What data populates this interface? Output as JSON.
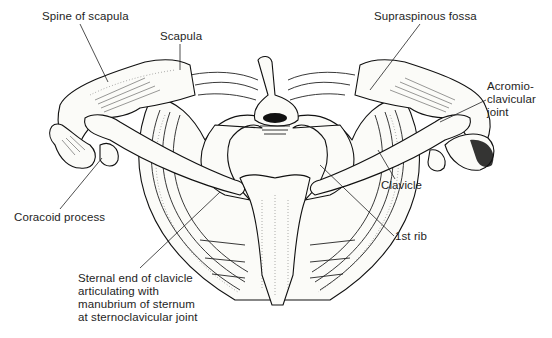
{
  "diagram": {
    "labels": [
      {
        "id": "spine-of-scapula",
        "text": "Spine of scapula",
        "x": 42,
        "y": 10
      },
      {
        "id": "scapula",
        "text": "Scapula",
        "x": 160,
        "y": 30
      },
      {
        "id": "supraspinous-fossa",
        "text": "Supraspinous fossa",
        "x": 374,
        "y": 10
      },
      {
        "id": "acromioclavicular-joint",
        "lines": [
          "Acromio-",
          "clavicular",
          "joint"
        ],
        "x": 487,
        "y": 80
      },
      {
        "id": "coracoid-process",
        "text": "Coracoid process",
        "x": 14,
        "y": 211
      },
      {
        "id": "clavicle",
        "text": "Clavicle",
        "x": 381,
        "y": 181
      },
      {
        "id": "first-rib",
        "text": "1st rib",
        "x": 395,
        "y": 231
      },
      {
        "id": "sternal-end-of-clavicle",
        "lines": [
          "Sternal end of clavicle",
          "articulating with",
          "manubrium of sternum",
          "at sternoclavicular joint"
        ],
        "x": 78,
        "y": 272
      }
    ],
    "colors": {
      "background": "#ffffff",
      "ink": "#111111",
      "text": "#1e1e1e"
    }
  }
}
